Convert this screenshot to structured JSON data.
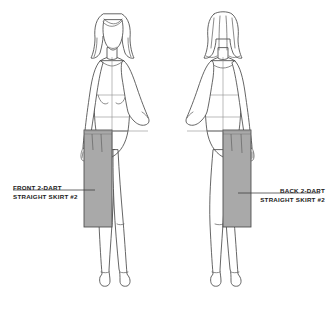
{
  "document": {
    "type": "fashion-croquis-technical-illustration",
    "background_color": "#ffffff",
    "width": 333,
    "height": 312
  },
  "labels": {
    "front": {
      "line1": "FRONT 2-DART",
      "line2": "STRAIGHT SKIRT #2",
      "leader_target": "front-skirt"
    },
    "back": {
      "line1": "BACK 2-DART",
      "line2": "STRAIGHT SKIRT #2",
      "leader_target": "back-skirt"
    }
  },
  "figures": {
    "front": {
      "name": "front-view-croquis",
      "view": "front",
      "pose": "left hand on hip",
      "garment": "straight skirt, 2 darts, half-rendered on figure left"
    },
    "back": {
      "name": "back-view-croquis",
      "view": "back",
      "pose": "right hand on hip",
      "garment": "straight skirt, 2 darts, half-rendered on figure right"
    }
  },
  "colors": {
    "skirt_fill": "#a9a9a9",
    "outline": "#4a4a4a",
    "construction_line": "#8a8a8a",
    "label_text": "#1a1a1a",
    "leader_line": "#3a3a3a"
  }
}
